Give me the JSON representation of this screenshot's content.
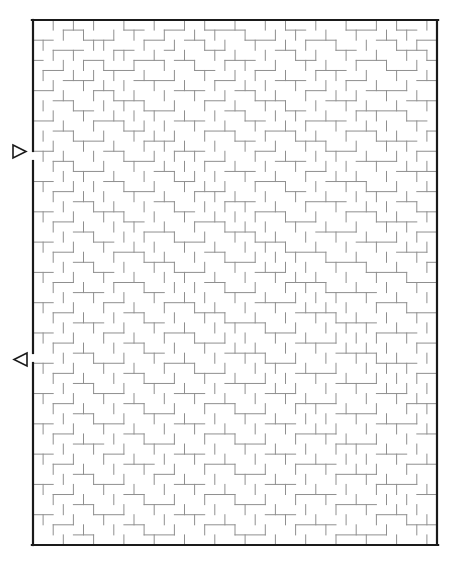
{
  "figure": {
    "kind": "maze-puzzle",
    "canvas": {
      "width": 462,
      "height": 567,
      "background": "#ffffff"
    }
  },
  "maze": {
    "columns": 40,
    "rows": 52,
    "cell_size": 10.1,
    "origin_x": 33,
    "origin_y": 20,
    "width": 404,
    "height": 525,
    "border_color": "#1a1a1a",
    "border_width": 2.2,
    "wall_color": "#8f8f8f",
    "wall_width": 1,
    "entrance": {
      "label": "entrance",
      "side": "left",
      "row": 13,
      "gap_y_start": 151,
      "gap_y_end": 161
    },
    "exit": {
      "label": "exit",
      "side": "left",
      "row": 33,
      "gap_y_start": 353,
      "gap_y_end": 363
    }
  },
  "markers": {
    "entrance_arrow": {
      "name": "entrance-arrow",
      "direction": "right",
      "glyph": "▷",
      "x": 13,
      "y": 145,
      "size": 13,
      "color": "#1a1a1a"
    },
    "exit_arrow": {
      "name": "exit-arrow",
      "direction": "left",
      "glyph": "◁",
      "x": 14,
      "y": 353,
      "size": 13,
      "color": "#1a1a1a"
    }
  },
  "chart_data": {
    "type": "maze",
    "grid": {
      "cols": 40,
      "rows": 52,
      "cell": 10.1
    },
    "entrance_cell": [
      0,
      13
    ],
    "exit_cell": [
      0,
      33
    ],
    "h_walls": [
      "0:3,4,9,10,13,14,17,18,19,20,25,26,31,32,33,36,37",
      "1:0,1,5,6,7,11,12,15,16,21,22,23,27,28,29,34,35,38,39",
      "2:2,3,4,8,9,13,17,18,24,25,30,31,36,37,38",
      "3:0,5,6,10,11,12,14,15,19,20,21,26,27,32,33,34,39",
      "4:1,2,7,8,9,16,17,22,23,28,29,30,35,36,37",
      "5:3,4,5,10,11,12,13,18,19,24,25,26,31,32,38,39",
      "6:0,1,6,7,14,15,16,20,21,27,28,33,34,35,36",
      "7:2,3,8,9,10,17,18,22,23,24,29,30,31,37,38,39",
      "8:4,5,11,12,13,19,20,25,26,32,33,34,35,36",
      "9:0,1,6,7,8,14,15,16,21,22,27,28,29,30,37,38",
      "10:2,3,9,10,17,18,19,23,24,25,31,32,33,39",
      "11:4,5,6,11,12,13,20,21,26,27,28,34,35,36,37",
      "12:0,1,7,8,14,15,16,22,23,29,30,31,38,39",
      "13:2,3,9,10,11,17,18,24,25,26,32,33,34,35",
      "14:4,5,6,12,13,19,20,21,27,28,36,37,38,39",
      "15:0,1,7,8,14,15,22,23,24,29,30,31,32",
      "16:2,3,9,10,11,16,17,18,25,26,33,34,35,38,39",
      "17:4,5,12,13,19,20,21,27,28,29,30,36,37",
      "18:0,1,6,7,8,14,15,22,23,24,31,32,33,38,39",
      "19:2,3,9,10,16,17,18,25,26,27,34,35,36,37",
      "20:4,5,11,12,13,19,20,21,28,29,30,31,38,39",
      "21:0,1,6,7,14,15,16,22,23,24,32,33,34,35",
      "22:2,3,8,9,10,17,18,25,26,27,28,36,37,38",
      "23:4,5,11,12,13,19,20,21,29,30,31,32,39",
      "24:0,1,6,7,14,15,16,22,23,24,33,34,35,36",
      "25:2,3,8,9,10,17,18,25,26,27,28,37,38,39",
      "26:4,5,6,11,12,19,20,21,29,30,31,32,33",
      "27:0,1,7,8,13,14,15,22,23,24,25,34,35,36",
      "28:2,3,9,10,16,17,18,26,27,28,29,37,38,39",
      "29:4,5,6,11,12,19,20,21,22,30,31,32,33",
      "30:0,1,7,8,13,14,15,23,24,25,34,35,36,37",
      "31:2,3,9,10,16,17,18,26,27,28,29,38,39",
      "32:4,5,11,12,19,20,21,22,30,31,32,33",
      "33:0,1,6,7,8,13,14,15,23,24,25,34,35,36,37",
      "34:2,3,9,10,16,17,18,26,27,28,29,38,39",
      "35:4,5,11,12,13,19,20,21,22,30,31,32,33",
      "36:0,1,6,7,8,14,15,16,23,24,25,34,35,36",
      "37:2,3,9,10,17,18,19,26,27,28,29,37,38,39",
      "38:4,5,11,12,13,20,21,22,30,31,32,33",
      "39:0,1,6,7,8,14,15,16,23,24,25,34,35,36,37",
      "40:2,3,9,10,17,18,19,26,27,28,29,38,39",
      "41:4,5,6,11,12,13,20,21,22,30,31,32,33",
      "42:0,1,7,8,14,15,16,23,24,25,34,35,36",
      "43:2,3,9,10,11,17,18,19,26,27,28,29,37,38,39",
      "44:4,5,12,13,20,21,22,30,31,32,33",
      "45:0,1,6,7,8,14,15,16,23,24,25,34,35,36,37",
      "46:2,3,9,10,17,18,19,26,27,28,29,38,39",
      "47:4,5,11,12,13,20,21,22,30,31,32,33",
      "48:0,1,6,7,8,14,15,16,23,24,25,34,35,36",
      "49:2,3,9,10,17,18,19,26,27,28,29,37,38,39",
      "50:4,5,11,12,13,20,21,22,30,31,32,33,34"
    ],
    "v_walls": [
      "0:1,3,5,8,11,14,16,19,22,24,27,30,33,35,38",
      "1:2,4,7,9,12,15,17,20,23,25,28,31,34,36",
      "2:0,5,6,10,13,16,18,21,24,26,29,32,35,37",
      "3:1,3,7,8,11,14,17,19,22,25,27,30,33,36,38",
      "4:2,4,6,9,12,15,18,20,23,26,28,31,34,37",
      "5:0,3,5,7,10,13,16,19,21,24,27,29,32,35,38",
      "6:1,4,6,8,11,14,17,20,22,25,28,30,33,36",
      "7:2,5,7,9,12,15,18,21,23,26,29,31,34,37",
      "8:0,3,6,8,10,13,16,19,22,24,27,30,32,35,38",
      "9:1,4,7,9,11,14,17,20,23,25,28,31,33,36",
      "10:2,5,8,10,12,15,18,21,24,26,29,32,34,37",
      "11:0,3,6,9,11,13,16,19,22,25,27,30,33,35,38",
      "12:1,4,7,10,12,14,17,20,23,26,28,31,34,36",
      "13:0,2,5,8,11,13,15,18,21,24,27,29,32,35,37",
      "14:1,3,6,9,12,14,16,19,22,25,28,30,33,36,38",
      "15:2,4,7,10,13,15,17,20,23,26,29,31,34,37",
      "16:0,3,5,8,11,14,16,18,21,24,27,30,32,35,38",
      "17:1,4,6,9,12,15,17,19,22,25,28,31,33,36",
      "18:2,5,7,10,13,16,18,20,23,26,29,32,34,37",
      "19:0,3,6,8,11,14,17,19,21,24,27,30,33,35,38",
      "20:1,4,7,9,12,15,18,20,22,25,28,31,34,36",
      "21:2,5,8,10,13,16,19,21,23,26,29,32,35,37",
      "22:0,3,6,9,11,14,17,20,22,24,27,30,33,36,38",
      "23:1,4,7,10,12,15,18,21,23,25,28,31,34,37",
      "24:2,5,8,11,13,16,19,22,24,26,29,32,35,38",
      "25:0,3,6,9,12,14,17,20,23,25,27,30,33,36",
      "26:1,4,7,10,13,15,18,21,24,26,28,31,34,37",
      "27:2,5,8,11,14,16,19,22,25,27,29,32,35,38",
      "28:0,3,6,9,12,15,17,20,23,26,28,30,33,36",
      "29:1,4,7,10,13,16,18,21,24,27,29,31,34,37",
      "30:2,5,8,11,14,17,19,22,25,28,30,32,35,38",
      "31:0,3,6,9,12,15,18,20,23,26,29,31,33,36",
      "32:1,4,7,10,13,16,19,21,24,27,30,32,34,37",
      "33:2,5,8,11,14,17,20,22,25,28,31,33,35,38",
      "34:0,3,6,9,12,15,18,21,23,26,29,32,34,36",
      "35:1,4,7,10,13,16,19,22,24,27,30,33,35,37",
      "36:2,5,8,11,14,17,20,23,25,28,31,34,36,38",
      "37:0,3,6,9,12,15,18,21,24,26,29,32,35,37",
      "38:1,4,7,10,13,16,19,22,25,27,30,33,36,38",
      "39:2,5,8,11,14,17,20,23,26,28,31,34,37",
      "40:0,3,6,9,12,15,18,21,24,27,29,32,35,38",
      "41:1,4,7,10,13,16,19,22,25,28,30,33,36",
      "42:2,5,8,11,14,17,20,23,26,29,31,34,37",
      "43:0,3,6,9,12,15,18,21,24,27,30,32,35,38",
      "44:1,4,7,10,13,16,19,22,25,28,31,33,36",
      "45:2,5,8,11,14,17,20,23,26,29,32,34,37",
      "46:0,3,6,9,12,15,18,21,24,27,30,33,35,38",
      "47:1,4,7,10,13,16,19,22,25,28,31,34,36",
      "48:2,5,8,11,14,17,20,23,26,29,32,35,37",
      "49:0,3,6,9,12,15,18,21,24,27,30,33,36,38",
      "50:1,4,7,10,13,16,19,22,25,28,31,34,37",
      "51:2,5,8,11,14,17,20,23,26,29,32,35,38"
    ]
  }
}
